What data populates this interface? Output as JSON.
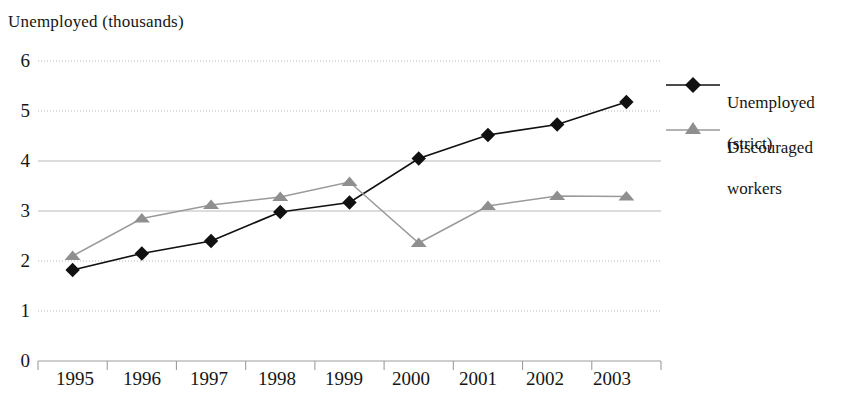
{
  "chart_data": {
    "type": "line",
    "title": "Unemployed (thousands)",
    "xlabel": "",
    "ylabel": "Unemployed (thousands)",
    "categories": [
      "1995",
      "1996",
      "1997",
      "1998",
      "1999",
      "2000",
      "2001",
      "2002",
      "2003"
    ],
    "ylim": [
      0,
      6
    ],
    "ytick_values": [
      "6",
      "5",
      "4",
      "3",
      "2",
      "1",
      "0"
    ],
    "grid": true,
    "grid_axis": "y",
    "legend_position": "right",
    "series": [
      {
        "name": "Unemployed (strict)",
        "label_line1": "Unemployed",
        "label_line2": "(strict)",
        "marker": "diamond",
        "color": "#111111",
        "values": [
          1.82,
          2.15,
          2.4,
          2.98,
          3.17,
          4.05,
          4.52,
          4.73,
          5.18
        ]
      },
      {
        "name": "Discouraged workers",
        "label_line1": "Discouraged",
        "label_line2": "workers",
        "marker": "triangle",
        "color": "#9a9a9a",
        "values": [
          2.1,
          2.85,
          3.12,
          3.28,
          3.58,
          2.36,
          3.1,
          3.3,
          3.29
        ]
      }
    ]
  },
  "axis": {
    "title": "Unemployed (thousands)",
    "y_ticks": [
      "6",
      "5",
      "4",
      "3",
      "2",
      "1",
      "0"
    ],
    "x_ticks": [
      "1995",
      "1996",
      "1997",
      "1998",
      "1999",
      "2000",
      "2001",
      "2002",
      "2003"
    ]
  },
  "legend": {
    "entries": [
      {
        "line1": "Unemployed",
        "line2": "(strict)"
      },
      {
        "line1": "Discouraged",
        "line2": "workers"
      }
    ]
  },
  "colors": {
    "series_strict": "#111111",
    "series_discouraged": "#9a9a9a",
    "gridline": "#b9b9b9",
    "axis": "#9d9d9d",
    "text": "#151515"
  }
}
